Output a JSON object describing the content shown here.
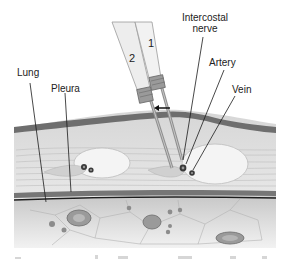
{
  "labels": {
    "lung": "Lung",
    "pleura": "Pleura",
    "intercostal_nerve_line1": "Intercostal",
    "intercostal_nerve_line2": "nerve",
    "artery": "Artery",
    "vein": "Vein"
  },
  "needles": {
    "needle_1": "1",
    "needle_2": "2"
  },
  "colors": {
    "skin_band": "#6e6e6e",
    "muscle": "#e4e4e4",
    "rib_oval": "#f4f4f4",
    "pleura_line": "#1e1e1e",
    "lung_tissue": "#cfcfcf",
    "needle_hub": "#ececec"
  }
}
